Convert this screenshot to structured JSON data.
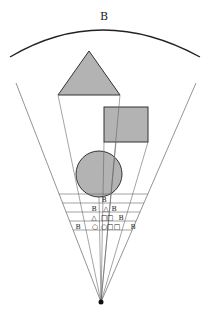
{
  "diagram": {
    "title_label": "B",
    "colors": {
      "shape_fill": "#b3b3b3",
      "shape_stroke": "#333333",
      "line": "#666666",
      "arc": "#222222",
      "apex": "#111111"
    },
    "apex": {
      "x": 101,
      "y": 302
    },
    "arc": {
      "x1": 10,
      "y1": 57,
      "peak_x": 101,
      "peak_y": 30,
      "x2": 200,
      "y2": 57
    },
    "fan_edges": [
      {
        "x": 16,
        "y": 83
      },
      {
        "x": 196,
        "y": 83
      }
    ],
    "shapes": [
      {
        "type": "triangle",
        "points": "89,51 58,95 120,95"
      },
      {
        "type": "square",
        "x": 104,
        "y": 107,
        "w": 44,
        "h": 35
      },
      {
        "type": "circle",
        "cx": 99,
        "cy": 174,
        "r": 23
      }
    ],
    "rays_from": [
      {
        "x": 58,
        "y": 95
      },
      {
        "x": 120,
        "y": 95
      },
      {
        "x": 104,
        "y": 142
      },
      {
        "x": 148,
        "y": 142
      },
      {
        "x": 116,
        "y": 142
      },
      {
        "x": 99,
        "y": 197
      }
    ],
    "grid_rows": [
      {
        "y": 194,
        "cells": [
          {
            "x": 104,
            "text": "B"
          }
        ]
      },
      {
        "y": 203,
        "cells": [
          {
            "x": 94,
            "text": "B"
          },
          {
            "x": 106,
            "text": "△"
          },
          {
            "x": 114,
            "text": "B"
          }
        ]
      },
      {
        "y": 212,
        "cells": [
          {
            "x": 94,
            "text": "△"
          },
          {
            "x": 104,
            "text": "□"
          },
          {
            "x": 110,
            "text": "□"
          },
          {
            "x": 121,
            "text": "B"
          }
        ]
      },
      {
        "y": 221,
        "cells": [
          {
            "x": 78,
            "text": "B"
          },
          {
            "x": 95,
            "text": "○"
          },
          {
            "x": 104,
            "text": "○"
          },
          {
            "x": 110,
            "text": "□"
          },
          {
            "x": 117,
            "text": "□"
          },
          {
            "x": 133,
            "text": "B"
          }
        ]
      }
    ],
    "grid_lines_y": [
      194,
      203,
      212,
      221,
      230
    ]
  }
}
